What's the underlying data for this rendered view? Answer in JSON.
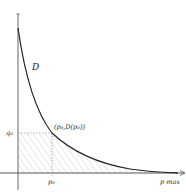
{
  "diagram": {
    "type": "demand-curve",
    "curve_label": "D",
    "point_label": "(p₀,D(p₀))",
    "y_tick_label": "q₀",
    "x_tick_label": "p₀",
    "x_end_label": "p max",
    "colors": {
      "axis": "#555555",
      "curve": "#222222",
      "guide": "#aaaaaa",
      "hatch": "#d4d4d4",
      "background": "#ffffff"
    },
    "shaded_regions": [
      "rectangle below q0 left of p0",
      "area under curve right of p0"
    ]
  }
}
